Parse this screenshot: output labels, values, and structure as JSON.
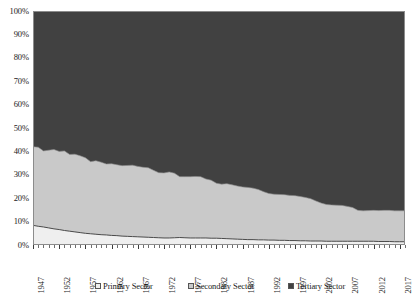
{
  "chart_data": {
    "type": "area",
    "stacked": "100%",
    "title": "",
    "subtitle": "",
    "xlabel": "",
    "ylabel": "",
    "xlim": [
      1947,
      2018
    ],
    "ylim": [
      0,
      100
    ],
    "grid": false,
    "legend_position": "bottom",
    "y_tick_labels": [
      "0%",
      "10%",
      "20%",
      "30%",
      "40%",
      "50%",
      "60%",
      "70%",
      "80%",
      "90%",
      "100%"
    ],
    "y_tick_values": [
      0,
      10,
      20,
      30,
      40,
      50,
      60,
      70,
      80,
      90,
      100
    ],
    "x_tick_labels": [
      "1947",
      "1952",
      "1957",
      "1962",
      "1967",
      "1972",
      "1977",
      "1982",
      "1987",
      "1992",
      "1997",
      "2002",
      "2007",
      "2012",
      "2017"
    ],
    "x_tick_values": [
      1947,
      1952,
      1957,
      1962,
      1967,
      1972,
      1977,
      1982,
      1987,
      1992,
      1997,
      2002,
      2007,
      2012,
      2017
    ],
    "x": [
      1947,
      1948,
      1949,
      1950,
      1951,
      1952,
      1953,
      1954,
      1955,
      1956,
      1957,
      1958,
      1959,
      1960,
      1961,
      1962,
      1963,
      1964,
      1965,
      1966,
      1967,
      1968,
      1969,
      1970,
      1971,
      1972,
      1973,
      1974,
      1975,
      1976,
      1977,
      1978,
      1979,
      1980,
      1981,
      1982,
      1983,
      1984,
      1985,
      1986,
      1987,
      1988,
      1989,
      1990,
      1991,
      1992,
      1993,
      1994,
      1995,
      1996,
      1997,
      1998,
      1999,
      2000,
      2001,
      2002,
      2003,
      2004,
      2005,
      2006,
      2007,
      2008,
      2009,
      2010,
      2011,
      2012,
      2013,
      2014,
      2015,
      2016,
      2017,
      2018
    ],
    "colors": {
      "primary": "#efefef",
      "secondary": "#c9c9c9",
      "tertiary": "#414141"
    },
    "series": [
      {
        "name": "Primary Sector",
        "color": "#efefef",
        "values": [
          8.4,
          8.0,
          7.7,
          7.3,
          6.9,
          6.6,
          6.2,
          5.9,
          5.6,
          5.3,
          5.0,
          4.8,
          4.6,
          4.4,
          4.3,
          4.1,
          4.0,
          3.8,
          3.7,
          3.6,
          3.5,
          3.4,
          3.3,
          3.2,
          3.1,
          3.0,
          3.0,
          3.1,
          3.2,
          3.1,
          3.0,
          3.0,
          3.0,
          3.0,
          2.9,
          2.9,
          2.8,
          2.7,
          2.6,
          2.5,
          2.4,
          2.3,
          2.3,
          2.2,
          2.2,
          2.1,
          2.1,
          2.0,
          2.0,
          1.9,
          1.9,
          1.8,
          1.8,
          1.7,
          1.7,
          1.7,
          1.6,
          1.6,
          1.6,
          1.6,
          1.6,
          1.6,
          1.6,
          1.6,
          1.6,
          1.6,
          1.5,
          1.5,
          1.5,
          1.4,
          1.4,
          1.4
        ]
      },
      {
        "name": "Secondary Sector",
        "color": "#c9c9c9",
        "values": [
          33.6,
          33.8,
          32.5,
          33.2,
          33.9,
          33.4,
          34.0,
          32.8,
          33.2,
          32.8,
          32.3,
          30.8,
          31.4,
          31.0,
          30.3,
          30.6,
          30.3,
          30.1,
          30.3,
          30.5,
          30.1,
          29.8,
          29.7,
          28.7,
          27.8,
          27.8,
          28.2,
          27.6,
          26.0,
          26.1,
          26.2,
          26.3,
          26.2,
          25.2,
          24.8,
          23.5,
          23.2,
          23.5,
          23.1,
          22.7,
          22.4,
          22.3,
          22.0,
          21.5,
          20.6,
          19.9,
          19.6,
          19.6,
          19.5,
          19.3,
          19.2,
          18.9,
          18.5,
          18.1,
          17.1,
          16.2,
          15.7,
          15.5,
          15.4,
          15.3,
          14.9,
          14.4,
          13.2,
          13.0,
          13.1,
          13.2,
          13.2,
          13.3,
          13.3,
          13.2,
          13.2,
          13.2
        ]
      },
      {
        "name": "Tertiary Sector",
        "color": "#414141",
        "values": [
          58.0,
          58.2,
          59.8,
          59.5,
          59.2,
          60.0,
          59.8,
          61.3,
          61.2,
          61.9,
          62.7,
          64.4,
          64.0,
          64.6,
          65.4,
          65.3,
          65.7,
          66.1,
          66.0,
          65.9,
          66.4,
          66.8,
          67.0,
          68.1,
          69.1,
          69.2,
          68.8,
          69.3,
          70.8,
          70.8,
          70.8,
          70.7,
          70.8,
          71.8,
          72.3,
          73.6,
          74.0,
          73.8,
          74.3,
          74.8,
          75.2,
          75.4,
          75.7,
          76.3,
          77.2,
          78.0,
          78.3,
          78.4,
          78.5,
          78.8,
          78.9,
          79.3,
          79.7,
          80.2,
          81.2,
          82.1,
          82.7,
          82.9,
          83.0,
          83.1,
          83.5,
          84.0,
          85.2,
          85.4,
          85.3,
          85.2,
          85.3,
          85.2,
          85.2,
          85.4,
          85.4,
          85.4
        ]
      }
    ]
  },
  "legend": {
    "items": [
      {
        "label": "Primary Sector",
        "color": "#efefef"
      },
      {
        "label": "Secondary Sector",
        "color": "#c9c9c9"
      },
      {
        "label": "Tertiary Sector",
        "color": "#414141"
      }
    ]
  }
}
